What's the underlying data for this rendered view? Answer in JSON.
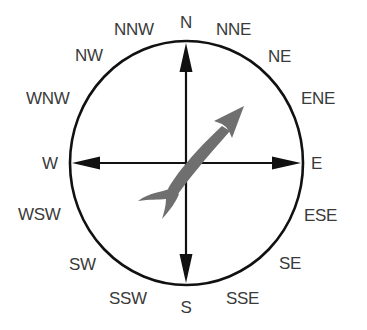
{
  "diagram": {
    "type": "compass-rose",
    "colors": {
      "ring": "#111111",
      "axes": "#111111",
      "label": "#3a3a3a",
      "fish_arrow": "#6f6f6f"
    },
    "labels": {
      "N": "N",
      "NNE": "NNE",
      "NE": "NE",
      "ENE": "ENE",
      "E": "E",
      "ESE": "ESE",
      "SE": "SE",
      "SSE": "SSE",
      "S": "S",
      "SSW": "SSW",
      "SW": "SW",
      "WSW": "WSW",
      "W": "W",
      "WNW": "WNW",
      "NW": "NW",
      "NNW": "NNW"
    },
    "pointer": {
      "shape": "fish-arrow",
      "points_toward": "NE"
    }
  }
}
